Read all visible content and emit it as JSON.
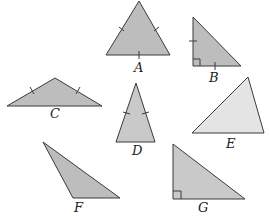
{
  "figure": {
    "colors": {
      "fill_dark": "#bdbdbd",
      "fill_light": "#e4e4e4",
      "stroke": "#3a3a3a"
    },
    "triangles": [
      {
        "label": "A",
        "type": "equilateral",
        "points": "139,1 170,55 106,55",
        "tick_marks": 3,
        "fill": "#bdbdbd"
      },
      {
        "label": "B",
        "type": "isosceles right",
        "points": "193,17 193,66 241,66",
        "tick_marks": 2,
        "right_angle": true,
        "fill": "#bdbdbd"
      },
      {
        "label": "C",
        "type": "isosceles obtuse",
        "points": "7,106 55,78 102,106",
        "tick_marks": 2,
        "fill": "#bdbdbd"
      },
      {
        "label": "D",
        "type": "isosceles acute",
        "points": "136,83 155,142 116,142",
        "tick_marks": 2,
        "fill": "#c9c9c9"
      },
      {
        "label": "E",
        "type": "scalene acute",
        "points": "192,133 248,77 264,133",
        "tick_marks": 0,
        "fill": "#e4e4e4"
      },
      {
        "label": "F",
        "type": "scalene obtuse",
        "points": "43,142 120,198 73,198",
        "tick_marks": 0,
        "fill": "#bdbdbd"
      },
      {
        "label": "G",
        "type": "scalene right",
        "points": "173,144 173,199 245,199",
        "tick_marks": 0,
        "right_angle": true,
        "fill": "#c9c9c9"
      }
    ],
    "labels": {
      "A": "A",
      "B": "B",
      "C": "C",
      "D": "D",
      "E": "E",
      "F": "F",
      "G": "G"
    }
  }
}
